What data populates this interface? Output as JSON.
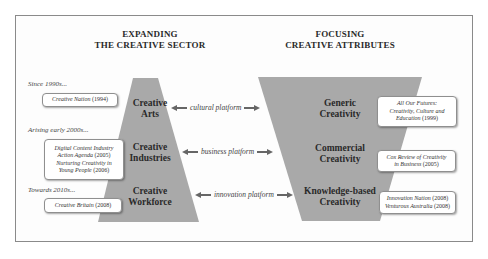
{
  "left_panel": {
    "heading": [
      "EXPANDING",
      "THE CREATIVE SECTOR"
    ],
    "tiers": [
      {
        "label": [
          "Creative",
          "Arts"
        ]
      },
      {
        "label": [
          "Creative",
          "Industries"
        ]
      },
      {
        "label": [
          "Creative",
          "Workforce"
        ]
      }
    ],
    "eras": [
      {
        "label": "Since 1990s...",
        "documents": [
          {
            "title": "Creative Nation",
            "year": "(1994)"
          }
        ]
      },
      {
        "label": "Arising early 2000s...",
        "documents": [
          {
            "title_lines": [
              "Digital Content Industry",
              "Action Agenda"
            ],
            "year": "(2005)"
          },
          {
            "title_lines": [
              "Nurturing Creativity in",
              "Young People"
            ],
            "year": "(2006)"
          }
        ]
      },
      {
        "label": "Towards 2010s...",
        "documents": [
          {
            "title": "Creative Britain",
            "year": "(2008)"
          }
        ]
      }
    ]
  },
  "platforms": [
    {
      "label": "cultural platform"
    },
    {
      "label": "business platform"
    },
    {
      "label": "innovation platform"
    }
  ],
  "right_panel": {
    "heading": [
      "FOCUSING",
      "CREATIVE ATTRIBUTES"
    ],
    "tiers": [
      {
        "label": [
          "Generic",
          "Creativity"
        ]
      },
      {
        "label": [
          "Commercial",
          "Creativity"
        ]
      },
      {
        "label": [
          "Knowledge-based",
          "Creativity"
        ]
      }
    ],
    "documents": [
      {
        "lines": [
          "All Our Futures:",
          "Creativity, Culture and",
          "Education"
        ],
        "year": "(1999)"
      },
      {
        "lines": [
          "Cox Review of Creativity",
          "in Business"
        ],
        "year": "(2005)"
      },
      {
        "items": [
          {
            "title": "Innovation Nation",
            "year": "(2008)"
          },
          {
            "title": "Venturous Australia",
            "year": "(2008)"
          }
        ]
      }
    ]
  },
  "colors": {
    "trapezoid_fill": "#a8a8a8",
    "frame_border": "#8a8a8a",
    "text": "#2a2a2a"
  }
}
